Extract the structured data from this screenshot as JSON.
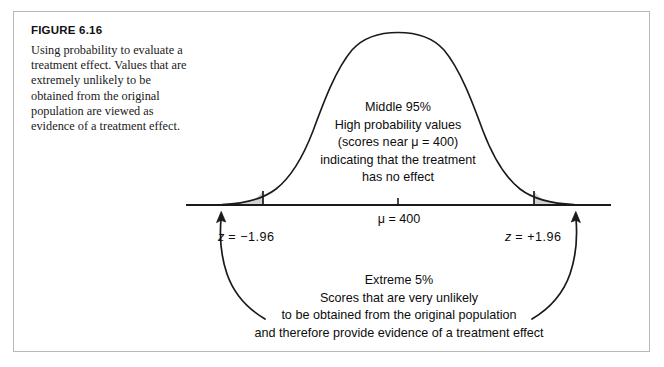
{
  "figure": {
    "label": "FIGURE 6.16",
    "caption": "Using probability to evaluate a treatment effect. Values that are extremely unlikely to be obtained from the original population are viewed as evidence of a treatment effect."
  },
  "annotations": {
    "middle": {
      "line1": "Middle 95%",
      "line2": "High probability values",
      "line3": "(scores near μ = 400)",
      "line4": "indicating that the treatment",
      "line5": "has no effect"
    },
    "extreme": {
      "line1": "Extreme 5%",
      "line2": "Scores that are very unlikely",
      "line3": "to be obtained from the original population",
      "line4": "and therefore provide evidence of a treatment effect"
    },
    "mean_label": "μ = 400",
    "z_left_label": "z = −1.96",
    "z_right_label": "z = +1.96"
  },
  "colors": {
    "curve_stroke": "#1a1a1a",
    "axis_stroke": "#1a1a1a",
    "tail_fill": "#d2d2d2",
    "tail_stroke": "#1a1a1a",
    "frame_border": "#b9b9bb",
    "text": "#0d0d0d",
    "background": "#ffffff"
  },
  "chart_data": {
    "type": "area",
    "title": "FIGURE 6.16",
    "distribution": "normal",
    "mean": 400,
    "mean_label": "μ = 400",
    "critical_z": [
      -1.96,
      1.96
    ],
    "middle_proportion_percent": 95,
    "tail_proportion_percent": 5,
    "tails_shaded": [
      "left",
      "right"
    ],
    "xlabel": "",
    "ylabel": "",
    "grid": false,
    "legend": false,
    "axis": {
      "baseline_y_px": 205,
      "x_start_px": 186,
      "x_end_px": 611,
      "center_tick_px": 398,
      "peak_y_px": 33
    },
    "shaded_regions": [
      {
        "name": "left-tail",
        "z_from": -4,
        "z_to": -1.96,
        "area_percent": 2.5
      },
      {
        "name": "right-tail",
        "z_from": 1.96,
        "z_to": 4,
        "area_percent": 2.5
      }
    ],
    "unshaded_region": {
      "name": "middle",
      "z_from": -1.96,
      "z_to": 1.96,
      "area_percent": 95
    }
  }
}
